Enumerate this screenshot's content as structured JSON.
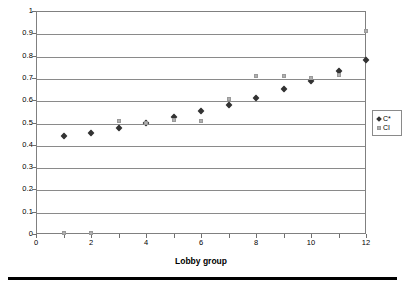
{
  "chart_data": {
    "type": "scatter",
    "title": "",
    "xlabel": "Lobby group",
    "ylabel": "",
    "xlim": [
      0,
      12
    ],
    "ylim": [
      0,
      1
    ],
    "x": [
      1,
      2,
      3,
      4,
      5,
      6,
      7,
      8,
      9,
      10,
      11,
      12
    ],
    "xticks": [
      0,
      2,
      4,
      6,
      8,
      10,
      12
    ],
    "xtick_labels": [
      "0",
      "2",
      "4",
      "6",
      "8",
      "10",
      "12"
    ],
    "xtick_minor": [
      1,
      3,
      5,
      7,
      9,
      11
    ],
    "yticks": [
      0,
      0.1,
      0.2,
      0.3,
      0.4,
      0.5,
      0.6,
      0.7,
      0.8,
      0.9,
      1
    ],
    "ytick_labels": [
      "0",
      "0.1",
      "0.2",
      "0.3",
      "0.4",
      "0.5",
      "0.6",
      "0.7",
      "0.8",
      "0.9",
      "1"
    ],
    "grid": true,
    "grid_axis": "y",
    "legend_position": "right",
    "series": [
      {
        "name": "C*",
        "marker": "diamond",
        "color": "#333333",
        "values": [
          0.44,
          0.455,
          0.475,
          0.5,
          0.525,
          0.55,
          0.58,
          0.61,
          0.648,
          0.688,
          0.733,
          0.782
        ]
      },
      {
        "name": "CI",
        "marker": "square",
        "color": "#b0b0b0",
        "values": [
          0.005,
          0.005,
          0.505,
          0.5,
          0.51,
          0.505,
          0.605,
          0.707,
          0.71,
          0.7,
          0.715,
          0.91
        ]
      }
    ]
  }
}
